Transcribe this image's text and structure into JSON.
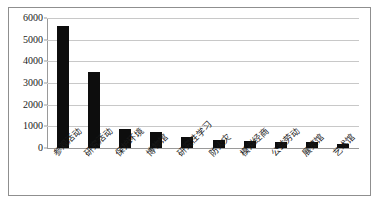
{
  "chart_data": {
    "type": "bar",
    "title": "",
    "subtitle": "",
    "xlabel": "",
    "ylabel": "",
    "categories": [
      "参观活动",
      "研究活动",
      "保护环境",
      "博物馆",
      "研究性学习",
      "防火灾",
      "模拟经商",
      "公益劳动",
      "展览馆",
      "艺术馆"
    ],
    "values": [
      5650,
      3520,
      880,
      760,
      520,
      350,
      330,
      260,
      260,
      200
    ],
    "ylim": [
      0,
      6000
    ],
    "yticks": [
      0,
      1000,
      2000,
      3000,
      4000,
      5000,
      6000
    ],
    "ytick_labels": [
      "0",
      "1000",
      "2000",
      "3000",
      "4000",
      "5000",
      "6000"
    ],
    "grid": true,
    "legend": false,
    "legend_position": "none",
    "series": [
      {
        "name": "",
        "color": "#0d0d0d",
        "values": [
          5650,
          3520,
          880,
          760,
          520,
          350,
          330,
          260,
          260,
          200
        ]
      }
    ]
  },
  "style": {
    "bar_color": "#0d0d0d",
    "gridline_color": "#c8c8c8",
    "axis_color": "#9a9a9a",
    "frame_color": "#8f8f8f",
    "background": "#ffffff",
    "text_color": "#1a1a1a"
  }
}
